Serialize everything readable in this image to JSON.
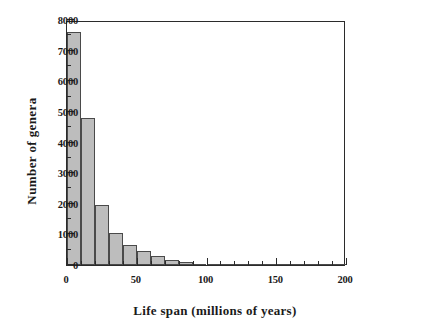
{
  "chart_data": {
    "type": "bar",
    "title": "",
    "xlabel": "Life span (millions of years)",
    "ylabel": "Number of genera",
    "xlim": [
      0,
      200
    ],
    "ylim": [
      0,
      8000
    ],
    "grid": false,
    "legend": null,
    "bin_width": 10,
    "x_major_ticks": [
      0,
      50,
      100,
      150,
      200
    ],
    "x_minor_tick_step": 10,
    "y_major_ticks": [
      0,
      1000,
      2000,
      3000,
      4000,
      5000,
      6000,
      7000,
      8000
    ],
    "y_minor_tick_step": 500,
    "x_tick_labels": [
      "0",
      "50",
      "100",
      "150",
      "200"
    ],
    "y_tick_labels": [
      "0",
      "1000",
      "2000",
      "3000",
      "4000",
      "5000",
      "6000",
      "7000",
      "8000"
    ],
    "bin_starts": [
      0,
      10,
      20,
      30,
      40,
      50,
      60,
      70,
      80,
      90,
      100,
      110,
      120,
      130,
      140,
      150,
      160,
      170,
      180,
      190
    ],
    "categories": [
      "0-10",
      "10-20",
      "20-30",
      "30-40",
      "40-50",
      "50-60",
      "60-70",
      "70-80",
      "80-90",
      "90-100",
      "100-110",
      "110-120",
      "120-130",
      "130-140",
      "140-150",
      "150-160",
      "160-170",
      "170-180",
      "180-190",
      "190-200"
    ],
    "values": [
      7600,
      4800,
      1950,
      1050,
      650,
      450,
      300,
      180,
      100,
      45,
      30,
      20,
      15,
      10,
      8,
      6,
      5,
      4,
      3,
      2
    ],
    "bar_fill_color": "#bdbdbd",
    "bar_edge_color": "#4a4a4a",
    "axis_color": "#2b2b2b",
    "background_color": "#ffffff"
  }
}
